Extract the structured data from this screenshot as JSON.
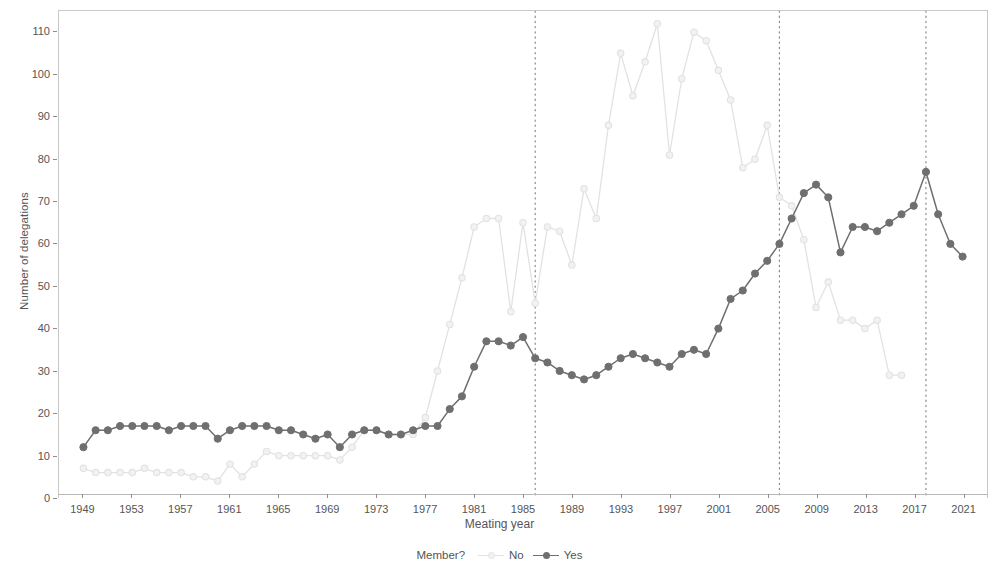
{
  "chart_data": {
    "type": "line",
    "title": "",
    "xlabel": "Meating year",
    "ylabel": "Number of delegations",
    "xlim": [
      1947,
      2023
    ],
    "ylim": [
      0,
      115
    ],
    "y_ticks": [
      0,
      10,
      20,
      30,
      40,
      50,
      60,
      70,
      80,
      90,
      100,
      110
    ],
    "x_ticks": [
      1949,
      1953,
      1957,
      1961,
      1965,
      1969,
      1973,
      1977,
      1981,
      1985,
      1989,
      1993,
      1997,
      2001,
      2005,
      2009,
      2013,
      2017,
      2021
    ],
    "grid": false,
    "legend_position": "bottom",
    "legend_title": "Member?",
    "vertical_reference_lines": [
      1986,
      2006,
      2018
    ],
    "colors": {
      "no": "#e2e2e2",
      "yes": "#6f6f6f",
      "reference_line": "#8a8a8a",
      "axis": "#555555",
      "panel_border": "#c9c9c9"
    },
    "x": [
      1949,
      1950,
      1951,
      1952,
      1953,
      1954,
      1955,
      1956,
      1957,
      1958,
      1959,
      1960,
      1961,
      1962,
      1963,
      1964,
      1965,
      1966,
      1967,
      1968,
      1969,
      1970,
      1971,
      1972,
      1973,
      1974,
      1975,
      1976,
      1977,
      1978,
      1979,
      1980,
      1981,
      1982,
      1983,
      1984,
      1985,
      1986,
      1987,
      1988,
      1989,
      1990,
      1991,
      1992,
      1993,
      1994,
      1995,
      1996,
      1997,
      1998,
      1999,
      2000,
      2001,
      2002,
      2003,
      2004,
      2005,
      2006,
      2007,
      2008,
      2009,
      2010,
      2011,
      2012,
      2013,
      2014,
      2015,
      2016,
      2017,
      2018,
      2019,
      2020,
      2021,
      2022
    ],
    "series": [
      {
        "name": "No",
        "marker": "open-circle",
        "color": "#e2e2e2",
        "values": [
          7,
          6,
          6,
          6,
          6,
          7,
          6,
          6,
          6,
          5,
          5,
          4,
          8,
          5,
          8,
          11,
          10,
          10,
          10,
          10,
          10,
          9,
          12,
          16,
          16,
          15,
          15,
          15,
          19,
          30,
          41,
          52,
          64,
          66,
          66,
          44,
          65,
          46,
          64,
          63,
          55,
          73,
          66,
          88,
          105,
          95,
          103,
          112,
          81,
          99,
          110,
          108,
          101,
          94,
          78,
          80,
          88,
          71,
          69,
          61,
          45,
          51,
          42,
          42,
          40,
          42,
          29,
          29,
          null,
          null,
          null,
          null,
          null,
          null
        ]
      },
      {
        "name": "Yes",
        "marker": "filled-circle",
        "color": "#6f6f6f",
        "values": [
          12,
          16,
          16,
          17,
          17,
          17,
          17,
          16,
          17,
          17,
          17,
          14,
          16,
          17,
          17,
          17,
          16,
          16,
          15,
          14,
          15,
          12,
          15,
          16,
          16,
          15,
          15,
          16,
          17,
          17,
          21,
          24,
          31,
          37,
          37,
          36,
          38,
          33,
          32,
          30,
          29,
          28,
          29,
          31,
          33,
          34,
          33,
          32,
          31,
          34,
          35,
          34,
          40,
          47,
          49,
          53,
          56,
          60,
          66,
          72,
          74,
          71,
          58,
          64,
          64,
          63,
          65,
          67,
          69,
          77,
          67,
          60,
          57,
          null
        ]
      }
    ]
  }
}
